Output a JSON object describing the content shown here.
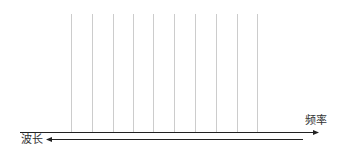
{
  "diagram": {
    "type": "spectrum-axis",
    "frequency_axis": {
      "label": "频率",
      "direction": "right"
    },
    "wavelength_axis": {
      "label": "波长",
      "direction": "left"
    },
    "vertical_lines": {
      "count": 10,
      "x_positions": [
        71,
        92,
        113,
        133,
        153,
        174,
        195,
        216,
        237,
        257
      ],
      "color": "#cccccc"
    },
    "colors": {
      "axis": "#222222",
      "grid_line": "#cccccc",
      "background": "#ffffff"
    }
  }
}
